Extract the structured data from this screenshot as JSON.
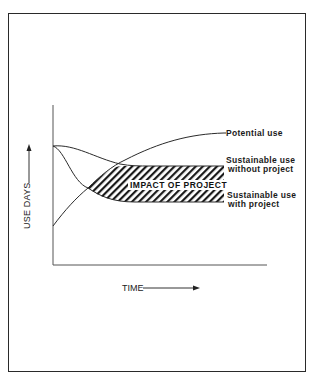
{
  "diagram": {
    "axes": {
      "y_label": "USE DAYS",
      "x_label": "TIME"
    },
    "curves": [
      {
        "name": "Potential use",
        "label": "Potential use"
      },
      {
        "name": "Sustainable use without project",
        "label_line1": "Sustainable use",
        "label_line2": "without project"
      },
      {
        "name": "Sustainable use with project",
        "label_line1": "Sustainable use",
        "label_line2": "with project"
      }
    ],
    "shaded_region": {
      "label": "IMPACT OF PROJECT",
      "pattern": "diagonal hatch"
    },
    "colors": {
      "line": "#2a2a2a",
      "background": "#ffffff"
    }
  }
}
